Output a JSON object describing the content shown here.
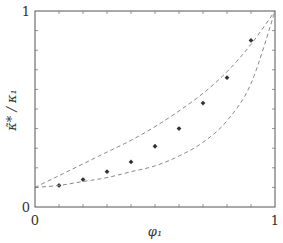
{
  "chart_data": {
    "type": "scatter",
    "title": "",
    "xlabel": "φ₁",
    "ylabel": "κ̃* / κ₁",
    "xlim": [
      0,
      1
    ],
    "ylim": [
      0,
      1
    ],
    "grid": false,
    "legend": null,
    "x_tick_labels": [
      {
        "value": 0,
        "label": "0"
      },
      {
        "value": 1,
        "label": "1"
      }
    ],
    "y_tick_labels": [
      {
        "value": 0,
        "label": "0"
      },
      {
        "value": 1,
        "label": "1"
      }
    ],
    "minor_tick_step": 0.1,
    "series": [
      {
        "name": "data",
        "kind": "points",
        "marker": "diamond",
        "color": "#333333",
        "x": [
          0.1,
          0.2,
          0.3,
          0.4,
          0.5,
          0.6,
          0.7,
          0.8,
          0.9
        ],
        "y": [
          0.11,
          0.14,
          0.18,
          0.23,
          0.31,
          0.4,
          0.53,
          0.66,
          0.85
        ]
      },
      {
        "name": "upper bound",
        "kind": "dashed-line",
        "color": "#888888",
        "x": [
          0,
          0.1,
          0.2,
          0.3,
          0.4,
          0.5,
          0.6,
          0.7,
          0.8,
          0.9,
          1.0
        ],
        "y": [
          0.1,
          0.16,
          0.22,
          0.28,
          0.34,
          0.41,
          0.49,
          0.58,
          0.69,
          0.83,
          1.0
        ]
      },
      {
        "name": "lower bound",
        "kind": "dashed-line",
        "color": "#888888",
        "x": [
          0,
          0.1,
          0.2,
          0.3,
          0.4,
          0.5,
          0.6,
          0.7,
          0.8,
          0.9,
          1.0
        ],
        "y": [
          0.1,
          0.11,
          0.13,
          0.15,
          0.18,
          0.21,
          0.26,
          0.33,
          0.44,
          0.63,
          1.0
        ]
      }
    ]
  },
  "plot": {
    "frame_color": "#555555",
    "tick_color": "#777777"
  }
}
